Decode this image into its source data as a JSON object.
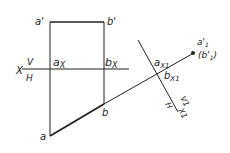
{
  "diagram": {
    "labels": {
      "a_prime": "a'",
      "b_prime": "b'",
      "X": "X",
      "V": "V",
      "H": "H",
      "a_x": "a",
      "a_x_sub": "X",
      "b_x": "b",
      "b_x_sub": "X",
      "a": "a",
      "b": "b",
      "a1_prime": "a'",
      "a1_sub": "1",
      "b1_prime": "(b'",
      "b1_sub": "1",
      "b1_close": ")",
      "a_x1": "a",
      "a_x1_sub": "X1",
      "b_x1": "b",
      "b_x1_sub": "X1",
      "V1": "V1",
      "H1": "H",
      "X1": "X1"
    },
    "color": "#222222"
  }
}
